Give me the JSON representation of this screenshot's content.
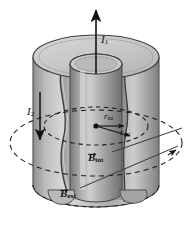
{
  "figure": {
    "type": "physics-diagram",
    "background_color": "#ffffff",
    "ink_color": "#111111",
    "shading": {
      "outer_shell_light": "#d8d8d8",
      "outer_shell_mid": "#b4b4b4",
      "outer_shell_dark": "#8a8a8a",
      "inner_conductor_light": "#cfcfcf",
      "inner_conductor_mid": "#a6a6a6",
      "inner_conductor_dark": "#767676",
      "top_face": "#c9c9c9",
      "cavity": "#9a9a9a"
    }
  },
  "labels": {
    "current_inner": {
      "symbol": "I",
      "subscript": "1",
      "direction": "up"
    },
    "current_outer": {
      "symbol": "I",
      "subscript": "2",
      "direction": "down"
    },
    "radius_internal": {
      "symbol": "r",
      "subscript": "int"
    },
    "radius_external": {
      "symbol": "r",
      "subscript": "ext"
    },
    "field_internal": {
      "symbol": "B",
      "subscript": "int",
      "vector": true
    },
    "field_external": {
      "symbol": "B",
      "subscript": "ext",
      "vector": true
    }
  },
  "elements": {
    "inner_loop": {
      "name": "Amperian loop r_int",
      "style": "dashed-ellipse"
    },
    "outer_loop": {
      "name": "Amperian loop r_ext",
      "style": "dashed-ellipse"
    },
    "bottom_loop": {
      "name": "cylinder base outline",
      "style": "dashed-ellipse"
    },
    "center_point": {
      "name": "axis point",
      "style": "filled-dot"
    }
  }
}
